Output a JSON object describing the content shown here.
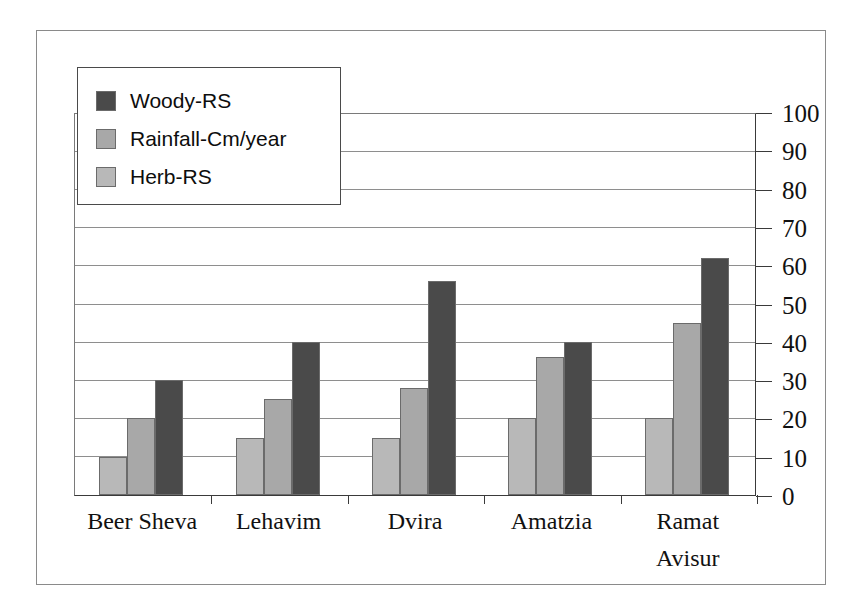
{
  "chart_data": {
    "type": "bar",
    "title": "",
    "xlabel": "",
    "ylabel": "",
    "ylim": [
      0,
      100
    ],
    "ytick_step": 10,
    "yticks": [
      100,
      90,
      80,
      70,
      60,
      50,
      40,
      30,
      20,
      10,
      0
    ],
    "grid": true,
    "y_axis_position": "right",
    "legend_position": "top-left",
    "categories": [
      "Beer Sheva",
      "Lehavim",
      "Dvira",
      "Amatzia",
      "Ramat Avisur"
    ],
    "category_lines": [
      [
        "Beer Sheva"
      ],
      [
        "Lehavim"
      ],
      [
        "Dvira"
      ],
      [
        "Amatzia"
      ],
      [
        "Ramat",
        "Avisur"
      ]
    ],
    "series": [
      {
        "name": "Herb-RS",
        "color": "#b8b8b8",
        "values": [
          10,
          15,
          15,
          20,
          20
        ]
      },
      {
        "name": "Rainfall-Cm/year",
        "color": "#a8a8a8",
        "values": [
          20,
          25,
          28,
          36,
          45
        ]
      },
      {
        "name": "Woody-RS",
        "color": "#4a4a4a",
        "values": [
          30,
          40,
          56,
          40,
          62
        ]
      }
    ],
    "legend_entries": [
      {
        "label": "Woody-RS",
        "color": "#4a4a4a"
      },
      {
        "label": "Rainfall-Cm/year",
        "color": "#a8a8a8"
      },
      {
        "label": "Herb-RS",
        "color": "#b8b8b8"
      }
    ]
  }
}
